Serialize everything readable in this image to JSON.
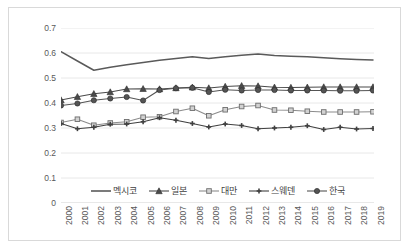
{
  "chart_data": {
    "type": "line",
    "title": "",
    "xlabel": "",
    "ylabel": "",
    "ylim": [
      0,
      0.7
    ],
    "yticks": [
      "0",
      "0.1",
      "0.2",
      "0.3",
      "0.4",
      "0.5",
      "0.6",
      "0.7"
    ],
    "ytick_values": [
      0,
      0.1,
      0.2,
      0.3,
      0.4,
      0.5,
      0.6,
      0.7
    ],
    "grid": true,
    "grid_axis": "y",
    "legend_position": "bottom",
    "x": [
      "2000",
      "2001",
      "2002",
      "2003",
      "2004",
      "2005",
      "2006",
      "2007",
      "2008",
      "2009",
      "2010",
      "2011",
      "2012",
      "2013",
      "2014",
      "2015",
      "2016",
      "2017",
      "2018",
      "2019"
    ],
    "categories": [
      "2000",
      "2001",
      "2002",
      "2003",
      "2004",
      "2005",
      "2006",
      "2007",
      "2008",
      "2009",
      "2010",
      "2011",
      "2012",
      "2013",
      "2014",
      "2015",
      "2016",
      "2017",
      "2018",
      "2019"
    ],
    "series": [
      {
        "name": "멕시코",
        "marker": "none",
        "color": "#5a5a5a",
        "values": [
          0.605,
          0.568,
          0.531,
          0.543,
          0.553,
          0.562,
          0.571,
          0.578,
          0.585,
          0.578,
          0.585,
          0.591,
          0.596,
          0.59,
          0.587,
          0.585,
          0.581,
          0.577,
          0.574,
          0.572
        ]
      },
      {
        "name": "일본",
        "marker": "triangle",
        "color": "#4a4a4a",
        "values": [
          0.412,
          0.425,
          0.437,
          0.444,
          0.456,
          0.457,
          0.456,
          0.46,
          0.463,
          0.46,
          0.466,
          0.469,
          0.468,
          0.463,
          0.462,
          0.463,
          0.464,
          0.464,
          0.464,
          0.464
        ]
      },
      {
        "name": "대만",
        "marker": "square",
        "color": "#8c8c8c",
        "values": [
          0.322,
          0.335,
          0.311,
          0.32,
          0.325,
          0.343,
          0.345,
          0.366,
          0.379,
          0.349,
          0.373,
          0.386,
          0.39,
          0.372,
          0.371,
          0.367,
          0.364,
          0.364,
          0.364,
          0.365
        ]
      },
      {
        "name": "스웨덴",
        "marker": "cross",
        "color": "#404040",
        "values": [
          0.318,
          0.297,
          0.303,
          0.315,
          0.316,
          0.325,
          0.341,
          0.331,
          0.318,
          0.304,
          0.316,
          0.31,
          0.297,
          0.3,
          0.303,
          0.309,
          0.294,
          0.303,
          0.296,
          0.298
        ]
      },
      {
        "name": "한국",
        "marker": "circle",
        "color": "#545454",
        "values": [
          0.39,
          0.398,
          0.411,
          0.418,
          0.424,
          0.41,
          0.452,
          0.459,
          0.461,
          0.444,
          0.453,
          0.45,
          0.452,
          0.452,
          0.45,
          0.45,
          0.45,
          0.449,
          0.449,
          0.45
        ]
      }
    ]
  },
  "legend": {
    "items": [
      {
        "label": "멕시코"
      },
      {
        "label": "일본"
      },
      {
        "label": "대만"
      },
      {
        "label": "스웨덴"
      },
      {
        "label": "한국"
      }
    ]
  }
}
